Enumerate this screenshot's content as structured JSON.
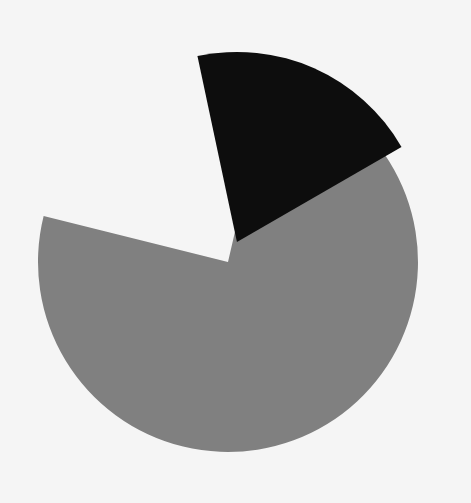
{
  "figure": {
    "background_color": "#f5f5f5",
    "width": 471,
    "height": 503
  },
  "chart_data": {
    "type": "pie",
    "title": "",
    "subtitle": "",
    "xlabel": "",
    "ylabel": "",
    "labels": [
      "Slice 1",
      "Slice 2"
    ],
    "values": [
      76,
      24
    ],
    "percentages": [
      "76%",
      "24%"
    ],
    "colors": [
      "#808080",
      "#0d0d0d"
    ],
    "explode": [
      0,
      0.11
    ],
    "exploded_slice_index": 1,
    "start_angle_deg": 90,
    "counterclock": false,
    "wedge_gap_deg": 6,
    "show_labels": false,
    "show_percent_labels": false,
    "show_legend": false,
    "legend_position": "none",
    "grid": false,
    "axes_visible": false,
    "center_x": 228,
    "center_y": 262,
    "radius": 190
  },
  "geometry": {
    "slices": [
      {
        "name": "gray-slice",
        "color": "#808080",
        "start_deg": 283,
        "end_deg": 554,
        "sweep_deg": 271,
        "offset_px": 0,
        "offset_dir_deg": 0
      },
      {
        "name": "black-slice",
        "color": "#0d0d0d",
        "start_deg": 258,
        "end_deg": 330,
        "sweep_deg": 72,
        "offset_px": 22,
        "offset_dir_deg": 294
      }
    ]
  }
}
